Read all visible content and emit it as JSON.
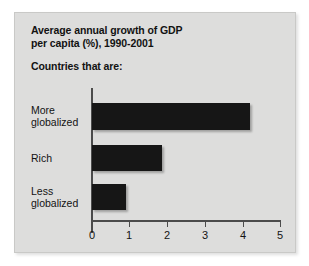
{
  "chart_data": {
    "type": "bar",
    "orientation": "horizontal",
    "title": "Average annual growth of GDP per capita (%), 1990-2001",
    "title_lines": [
      "Average annual growth of GDP",
      "per capita (%), 1990-2001"
    ],
    "subtitle": "Countries that are:",
    "categories": [
      "More globalized",
      "Rich",
      "Less globalized"
    ],
    "category_lines": [
      [
        "More",
        "globalized"
      ],
      [
        "Rich"
      ],
      [
        "Less",
        "globalized"
      ]
    ],
    "values": [
      4.2,
      1.85,
      0.9
    ],
    "xlabel": "",
    "ylabel": "",
    "xlim": [
      0,
      5
    ],
    "xticks": [
      0,
      1,
      2,
      3,
      4,
      5
    ],
    "xtick_labels": [
      "0",
      "1",
      "2",
      "3",
      "4",
      "5"
    ],
    "grid": false,
    "legend": false,
    "bar_color": "#161616",
    "panel_color": "#dddddc",
    "axis_color": "#4b4b4b",
    "text_color": "#121212"
  }
}
